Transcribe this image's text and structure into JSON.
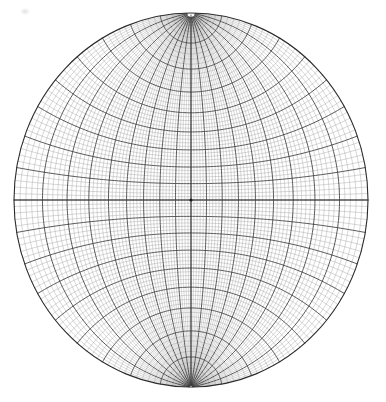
{
  "figure": {
    "caption": "",
    "background_color": "#ffffff"
  },
  "chart_data": {
    "type": "scatter",
    "subtitle": "",
    "xlabel": "",
    "ylabel": "",
    "projection": "stereographic-equal-angle",
    "orientation": "equatorial (poles at top and bottom of primitive circle)",
    "grid": true,
    "legend_position": "none",
    "annotations": [],
    "tick_labels": [],
    "geometry": {
      "center_x": 191,
      "center_y": 200,
      "radius_x": 177,
      "radius_y": 187,
      "pole_north_x": 191,
      "pole_north_y": 14,
      "pole_south_x": 191,
      "pole_south_y": 386,
      "center_dot_radius": 1.6
    },
    "graticule": {
      "fine_interval_degrees": 2,
      "bold_interval_degrees": 10,
      "latitude_range": [
        -88,
        88
      ],
      "longitude_range": [
        -90,
        90
      ],
      "meridian_count_fine": 90,
      "meridian_count_bold": 18,
      "parallel_count_fine": 88,
      "parallel_count_bold": 17
    },
    "colors": {
      "fine_line": "#9a9a9a",
      "bold_line": "#3a3a3a",
      "primitive_circle": "#2b2b2b",
      "center_dot": "#1a1a1a",
      "background": "#ffffff"
    },
    "line_widths": {
      "fine": 0.4,
      "bold": 0.85,
      "primitive": 1.1
    },
    "x": [
      0
    ],
    "values": [
      0
    ],
    "categories": [
      "center"
    ]
  }
}
